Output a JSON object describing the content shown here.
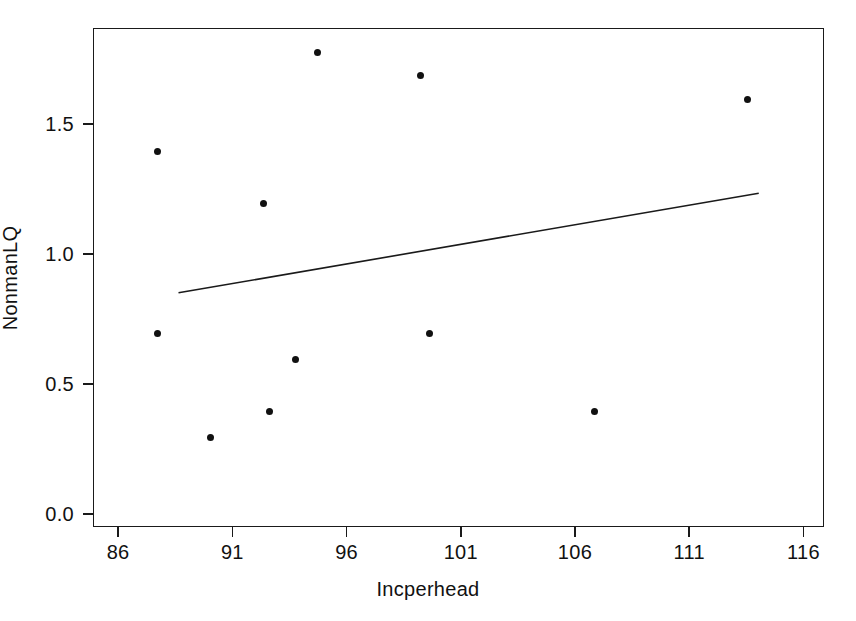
{
  "chart_data": {
    "type": "scatter",
    "title": "",
    "xlabel": "Incperhead",
    "ylabel": "NonmanLQ",
    "xlim": [
      84.9,
      116.9
    ],
    "ylim": [
      -0.05,
      1.87
    ],
    "grid": false,
    "legend": "none",
    "xticks": [
      86,
      91,
      96,
      101,
      106,
      111,
      116
    ],
    "xticklabels": [
      "86",
      "91",
      "96",
      "101",
      "106",
      "111",
      "116"
    ],
    "yticks": [
      0.0,
      0.5,
      1.0,
      1.5
    ],
    "yticklabels": [
      "0.0",
      "0.5",
      "1.0",
      "1.5"
    ],
    "marker_color": "#111111",
    "line_color": "#1a1a1a",
    "points": [
      {
        "x": 87.7,
        "y": 1.4
      },
      {
        "x": 87.7,
        "y": 0.7
      },
      {
        "x": 90.0,
        "y": 0.3
      },
      {
        "x": 92.3,
        "y": 1.2
      },
      {
        "x": 92.6,
        "y": 0.4
      },
      {
        "x": 93.7,
        "y": 0.6
      },
      {
        "x": 94.7,
        "y": 1.78
      },
      {
        "x": 99.2,
        "y": 1.69
      },
      {
        "x": 99.6,
        "y": 0.7
      },
      {
        "x": 106.8,
        "y": 0.4
      },
      {
        "x": 113.5,
        "y": 1.6
      }
    ],
    "fit_line": {
      "label": "regression-line",
      "x0": 88.6,
      "y0": 0.855,
      "x1": 114.0,
      "y1": 1.238
    }
  }
}
